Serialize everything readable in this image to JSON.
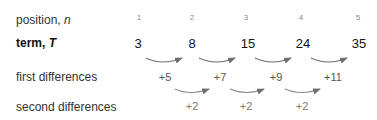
{
  "rows": {
    "position": {
      "label": "position, ",
      "var": "n"
    },
    "term": {
      "label": "term, ",
      "var": "T"
    },
    "first": {
      "label": "first differences"
    },
    "second": {
      "label": "second differences"
    }
  },
  "positions": [
    "1",
    "2",
    "3",
    "4",
    "5"
  ],
  "terms": [
    "3",
    "8",
    "15",
    "24",
    "35"
  ],
  "first_differences": [
    "+5",
    "+7",
    "+9",
    "+11"
  ],
  "second_differences": [
    "+2",
    "+2",
    "+2"
  ],
  "colors": {
    "arrow": "#6e6e6e"
  }
}
